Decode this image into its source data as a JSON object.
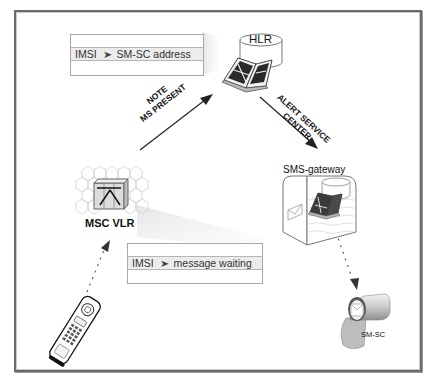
{
  "diagram": {
    "title": "",
    "nodes": {
      "hlr": {
        "label": "HLR"
      },
      "msc_vlr": {
        "label": "MSC VLR"
      },
      "sms_gateway": {
        "label": "SMS-gateway"
      },
      "sm_sc": {
        "label": "SM-SC"
      },
      "mobile_station": {
        "label": ""
      }
    },
    "tables": {
      "hlr_record": {
        "key": "IMSI",
        "value": "SM-SC address"
      },
      "vlr_record": {
        "key": "IMSI",
        "value": "message waiting"
      }
    },
    "edges": {
      "note_ms_present": {
        "line1": "NOTE",
        "line2": "MS PRESENT"
      },
      "alert_service_center": {
        "line1": "ALERT SERVICE",
        "line2": "CENTER"
      }
    },
    "arrow_glyph": "➤",
    "colors": {
      "frame": "#6a6a6a",
      "table_fill": "#ececec",
      "shadow": "#e6e6e6",
      "text": "#111111"
    }
  }
}
